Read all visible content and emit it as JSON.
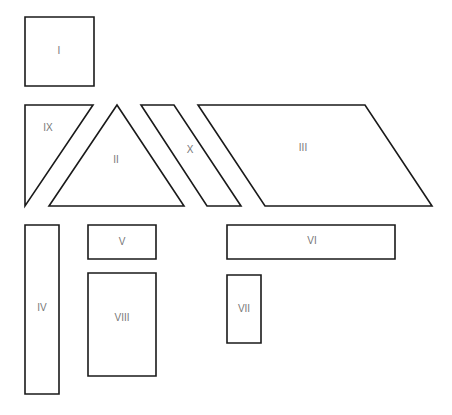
{
  "diagram": {
    "shapes": [
      {
        "id": "I",
        "type": "square",
        "label": "I",
        "points": [
          [
            25,
            17
          ],
          [
            94,
            17
          ],
          [
            94,
            86
          ],
          [
            25,
            86
          ]
        ],
        "label_pos": [
          59,
          51
        ]
      },
      {
        "id": "IX",
        "type": "right-triangle",
        "label": "IX",
        "points": [
          [
            25,
            105
          ],
          [
            93,
            105
          ],
          [
            25,
            206
          ]
        ],
        "label_pos": [
          48,
          128
        ]
      },
      {
        "id": "II",
        "type": "triangle",
        "label": "II",
        "points": [
          [
            117,
            105
          ],
          [
            184,
            206
          ],
          [
            49,
            206
          ]
        ],
        "label_pos": [
          116,
          160
        ]
      },
      {
        "id": "X",
        "type": "parallelogram",
        "label": "X",
        "points": [
          [
            141,
            105
          ],
          [
            174,
            105
          ],
          [
            241,
            206
          ],
          [
            207,
            206
          ]
        ],
        "label_pos": [
          190,
          150
        ]
      },
      {
        "id": "III",
        "type": "parallelogram",
        "label": "III",
        "points": [
          [
            198,
            105
          ],
          [
            365,
            105
          ],
          [
            432,
            206
          ],
          [
            265,
            206
          ]
        ],
        "label_pos": [
          303,
          148
        ]
      },
      {
        "id": "IV",
        "type": "rectangle",
        "label": "IV",
        "points": [
          [
            25,
            225
          ],
          [
            59,
            225
          ],
          [
            59,
            394
          ],
          [
            25,
            394
          ]
        ],
        "label_pos": [
          42,
          308
        ]
      },
      {
        "id": "V",
        "type": "rectangle",
        "label": "V",
        "points": [
          [
            88,
            225
          ],
          [
            156,
            225
          ],
          [
            156,
            259
          ],
          [
            88,
            259
          ]
        ],
        "label_pos": [
          122,
          242
        ]
      },
      {
        "id": "VIII",
        "type": "rectangle",
        "label": "VIII",
        "points": [
          [
            88,
            273
          ],
          [
            156,
            273
          ],
          [
            156,
            376
          ],
          [
            88,
            376
          ]
        ],
        "label_pos": [
          122,
          318
        ]
      },
      {
        "id": "VI",
        "type": "rectangle",
        "label": "VI",
        "points": [
          [
            227,
            225
          ],
          [
            395,
            225
          ],
          [
            395,
            259
          ],
          [
            227,
            259
          ]
        ],
        "label_pos": [
          312,
          241
        ]
      },
      {
        "id": "VII",
        "type": "rectangle",
        "label": "VII",
        "points": [
          [
            227,
            275
          ],
          [
            261,
            275
          ],
          [
            261,
            343
          ],
          [
            227,
            343
          ]
        ],
        "label_pos": [
          244,
          309
        ]
      }
    ],
    "colors": {
      "stroke": "#1a1a1a",
      "fill": "#ffffff",
      "label": "#777777"
    }
  }
}
